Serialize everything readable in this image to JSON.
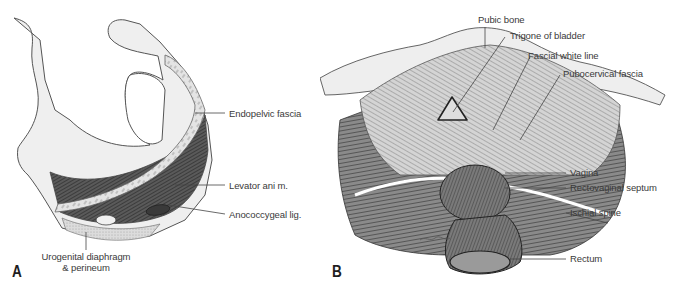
{
  "figure": {
    "panels": [
      {
        "letter": "A",
        "labels": {
          "endopelvic_fascia": "Endopelvic fascia",
          "levator_ani": "Levator ani m.",
          "anococcygeal": "Anococcygeal lig.",
          "urogenital_line1": "Urogenital diaphragm",
          "urogenital_line2": "& perineum"
        }
      },
      {
        "letter": "B",
        "labels": {
          "pubic_bone": "Pubic bone",
          "trigone": "Trigone of bladder",
          "fascial_white_line": "Fascial white line",
          "pubocervical_fascia": "Pubocervical fascia",
          "vagina": "Vagina",
          "rectovaginal_septum": "Rectovaginal septum",
          "ischial_spine": "Ischial spine",
          "rectum": "Rectum"
        }
      }
    ],
    "colors": {
      "bone_fill": "#efefef",
      "outline": "#555555",
      "muscle_dark": "#4a4a4a",
      "fascia_light": "#d9d9d9",
      "leader_line": "#444444",
      "text": "#3a3a3a"
    }
  }
}
